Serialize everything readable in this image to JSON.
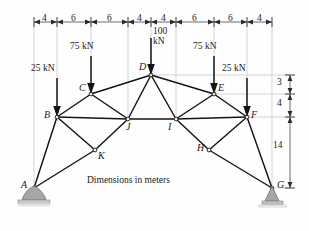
{
  "figure": {
    "caption": "Dimensions in meters",
    "units": "meters",
    "type": "truss-structural-diagram"
  },
  "top_dimensions": {
    "label": "top-span-dimension-chain",
    "segments": [
      "4",
      "6",
      "6",
      "4",
      "4",
      "6",
      "6",
      "4"
    ],
    "total": 40
  },
  "right_dimensions": {
    "label": "right-height-dimension-chain",
    "segments": [
      "3",
      "4",
      "14"
    ]
  },
  "loads": [
    {
      "name": "load-25kN-left",
      "label": "25 kN",
      "magnitude": 25,
      "unit": "kN",
      "applied_at": "B",
      "direction": "down"
    },
    {
      "name": "load-75kN-left",
      "label": "75 kN",
      "magnitude": 75,
      "unit": "kN",
      "applied_at": "C",
      "direction": "down"
    },
    {
      "name": "load-100kN-apex",
      "label_line1": "100",
      "label_line2": "kN",
      "magnitude": 100,
      "unit": "kN",
      "applied_at": "D",
      "direction": "down"
    },
    {
      "name": "load-75kN-right",
      "label": "75 kN",
      "magnitude": 75,
      "unit": "kN",
      "applied_at": "E",
      "direction": "down"
    },
    {
      "name": "load-25kN-right",
      "label": "25 kN",
      "magnitude": 25,
      "unit": "kN",
      "applied_at": "F",
      "direction": "down"
    }
  ],
  "joints": [
    {
      "id": "A",
      "label": "A",
      "x": 34,
      "y": 188,
      "support": "pin-rounded"
    },
    {
      "id": "B",
      "label": "B",
      "x": 57,
      "y": 117,
      "support": "none"
    },
    {
      "id": "C",
      "label": "C",
      "x": 91,
      "y": 94,
      "support": "none"
    },
    {
      "id": "D",
      "label": "D",
      "x": 151,
      "y": 75,
      "support": "none"
    },
    {
      "id": "E",
      "label": "E",
      "x": 214,
      "y": 94,
      "support": "none"
    },
    {
      "id": "F",
      "label": "F",
      "x": 247,
      "y": 117,
      "support": "none"
    },
    {
      "id": "G",
      "label": "G",
      "x": 272,
      "y": 188,
      "support": "pin-block"
    },
    {
      "id": "H",
      "label": "H",
      "x": 209,
      "y": 150,
      "support": "none"
    },
    {
      "id": "I",
      "label": "I",
      "x": 176,
      "y": 119,
      "support": "none"
    },
    {
      "id": "J",
      "label": "J",
      "x": 128,
      "y": 119,
      "support": "none"
    },
    {
      "id": "K",
      "label": "K",
      "x": 95,
      "y": 150,
      "support": "none"
    }
  ],
  "members": [
    [
      "A",
      "B"
    ],
    [
      "A",
      "K"
    ],
    [
      "B",
      "C"
    ],
    [
      "B",
      "J"
    ],
    [
      "B",
      "K"
    ],
    [
      "C",
      "D"
    ],
    [
      "C",
      "J"
    ],
    [
      "D",
      "E"
    ],
    [
      "D",
      "J"
    ],
    [
      "D",
      "I"
    ],
    [
      "E",
      "F"
    ],
    [
      "E",
      "I"
    ],
    [
      "F",
      "I"
    ],
    [
      "F",
      "H"
    ],
    [
      "F",
      "G"
    ],
    [
      "H",
      "G"
    ],
    [
      "H",
      "I"
    ],
    [
      "J",
      "I"
    ],
    [
      "J",
      "K"
    ],
    [
      "K",
      "A"
    ]
  ],
  "supports": [
    {
      "name": "support-A",
      "joint": "A",
      "kind": "pin-rounded"
    },
    {
      "name": "support-G",
      "joint": "G",
      "kind": "pin-block"
    }
  ],
  "colors": {
    "member": "#1a1a1a",
    "guide": "#bfbfbf",
    "support_fill": "#a9a9a9",
    "support_stroke": "#6b6b6b",
    "text": "#1a1a1a",
    "background": "#fefefe"
  }
}
